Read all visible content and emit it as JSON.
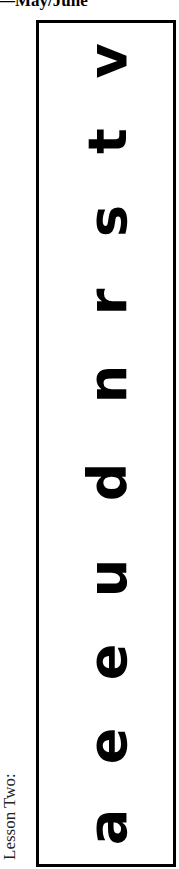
{
  "header": {
    "title": "—May/June"
  },
  "side_label": "Lesson Two:",
  "letters": [
    {
      "char": "a",
      "y": 827
    },
    {
      "char": "e",
      "y": 746
    },
    {
      "char": "e",
      "y": 662
    },
    {
      "char": "u",
      "y": 578
    },
    {
      "char": "d",
      "y": 482
    },
    {
      "char": "n",
      "y": 384
    },
    {
      "char": "r",
      "y": 302
    },
    {
      "char": "s",
      "y": 221
    },
    {
      "char": "t",
      "y": 141
    },
    {
      "char": "v",
      "y": 61
    }
  ]
}
